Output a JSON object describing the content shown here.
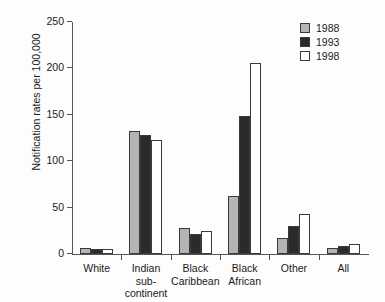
{
  "chart_data": {
    "type": "bar",
    "title": "",
    "xlabel": "",
    "ylabel": "Notification rates per 100,000",
    "ylim": [
      0,
      250
    ],
    "yticks": [
      0,
      50,
      100,
      150,
      200,
      250
    ],
    "grid": false,
    "legend_position": "top-right",
    "categories": [
      "White",
      "Indian sub-continent",
      "Black Caribbean",
      "Black African",
      "Other",
      "All"
    ],
    "category_lines": [
      [
        "White",
        ""
      ],
      [
        "Indian sub-",
        "continent"
      ],
      [
        "Black",
        "Caribbean"
      ],
      [
        "Black",
        "African"
      ],
      [
        "Other",
        ""
      ],
      [
        "All",
        ""
      ]
    ],
    "series": [
      {
        "name": "1988",
        "color": "#b4b4b4",
        "values": [
          6,
          133,
          28,
          62,
          17,
          6
        ]
      },
      {
        "name": "1993",
        "color": "#2b2b2b",
        "values": [
          5,
          128,
          22,
          149,
          30,
          9
        ]
      },
      {
        "name": "1998",
        "color": "#ffffff",
        "values": [
          5,
          123,
          25,
          206,
          43,
          11
        ]
      }
    ]
  },
  "legend": {
    "items": [
      {
        "label": "1988",
        "swatch": "y1988"
      },
      {
        "label": "1993",
        "swatch": "y1993"
      },
      {
        "label": "1998",
        "swatch": "y1998"
      }
    ]
  }
}
